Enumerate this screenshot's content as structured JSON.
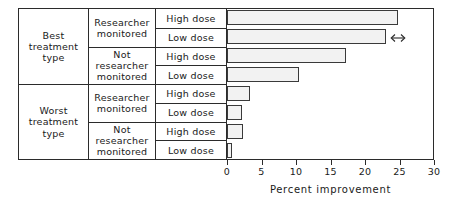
{
  "chart_data": {
    "type": "bar",
    "orientation": "horizontal",
    "title": "",
    "xlabel": "Percent improvement",
    "ylabel": "",
    "xlim": [
      0,
      30
    ],
    "xticks": [
      0,
      5,
      10,
      15,
      20,
      25,
      30
    ],
    "xticklabels": [
      "0",
      "5",
      "10",
      "15",
      "20",
      "25",
      "30"
    ],
    "grid": false,
    "legend": false,
    "categories": [
      "Best treatment type / Researcher monitored / High dose",
      "Best treatment type / Researcher monitored / Low dose",
      "Best treatment type / Not researcher monitored / High dose",
      "Best treatment type / Not researcher monitored / Low dose",
      "Worst treatment type / Researcher monitored / High dose",
      "Worst treatment type / Researcher monitored / Low dose",
      "Worst treatment type / Not researcher monitored / High dose",
      "Worst treatment type / Not researcher monitored / Low dose"
    ],
    "values": [
      24.8,
      23.0,
      17.3,
      10.4,
      3.3,
      2.2,
      2.3,
      0.7
    ],
    "bar_fill": "#f2f2f2",
    "bar_pattern": "dotted-stipple",
    "bar_edge_color": "#3a3a3a",
    "annotations": [
      {
        "name": "double-headed-arrow",
        "glyph": "arrow-left-right-icon",
        "attached_to_bar_index": 1,
        "x_value": 23.5
      }
    ]
  },
  "row_matrix": {
    "treatment_groups": [
      {
        "label": "Best\ntreatment\ntype"
      },
      {
        "label": "Worst\ntreatment\ntype"
      }
    ],
    "monitor_groups": [
      {
        "label": "Researcher\nmonitored"
      },
      {
        "label": "Not\nresearcher\nmonitored"
      },
      {
        "label": "Researcher\nmonitored"
      },
      {
        "label": "Not\nresearcher\nmonitored"
      }
    ],
    "dose_rows": [
      {
        "label": "High dose"
      },
      {
        "label": "Low dose"
      },
      {
        "label": "High dose"
      },
      {
        "label": "Low dose"
      },
      {
        "label": "High dose"
      },
      {
        "label": "Low dose"
      },
      {
        "label": "High dose"
      },
      {
        "label": "Low dose"
      }
    ]
  }
}
